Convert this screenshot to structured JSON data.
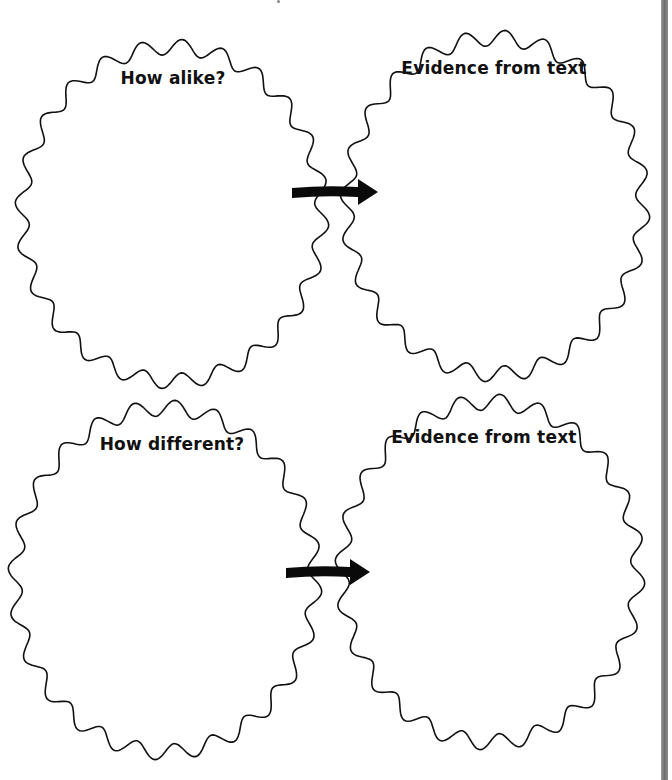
{
  "page": {
    "background": "#ffffff",
    "edge_bar_color": "#7a7a7a"
  },
  "organizer": {
    "rows": [
      {
        "left": {
          "title": "How alike?",
          "shape": {
            "cx": 172,
            "cy": 214,
            "rx": 150,
            "ry": 167,
            "waves": 24
          },
          "title_pos": {
            "x": 173,
            "y": 78
          }
        },
        "right": {
          "title": "Evidence from text",
          "shape": {
            "cx": 495,
            "cy": 206,
            "rx": 148,
            "ry": 168,
            "waves": 24
          },
          "title_pos": {
            "x": 494,
            "y": 68
          }
        },
        "arrow": {
          "x1": 292,
          "y1": 193,
          "x2": 378,
          "y2": 192
        }
      },
      {
        "left": {
          "title": "How different?",
          "shape": {
            "cx": 165,
            "cy": 580,
            "rx": 150,
            "ry": 172,
            "waves": 24
          },
          "title_pos": {
            "x": 172,
            "y": 444
          }
        },
        "right": {
          "title": "Evidence from text",
          "shape": {
            "cx": 490,
            "cy": 572,
            "rx": 148,
            "ry": 170,
            "waves": 24
          },
          "title_pos": {
            "x": 484,
            "y": 437
          }
        },
        "arrow": {
          "x1": 286,
          "y1": 573,
          "x2": 370,
          "y2": 572
        }
      }
    ]
  },
  "icons": {
    "connector_arrow": "right-arrow-icon"
  }
}
